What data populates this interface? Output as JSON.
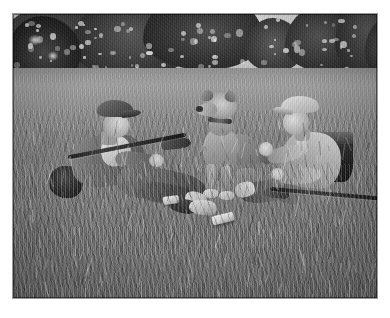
{
  "page": {
    "background_color": "#ffffff",
    "width": 390,
    "height": 318
  },
  "photograph": {
    "title": "Two boys with a dog resting in a meadow",
    "medium": "black-and-white photograph",
    "border_color": "#ffffff",
    "frame_border_color": "#9a9a9a",
    "tone": "monochrome grayscale",
    "alt_text": "Vintage black and white photo of two boys in flat caps sitting in tall grass with a dog sitting upright between them, rifles and a knapsack on the ground, a dark treeline and bright sky behind.",
    "scene": {
      "setting": "open grassy meadow",
      "time_of_day": "daytime",
      "background": {
        "sky_label": "bright overcast sky",
        "sky_color": "#f4f4f4",
        "treeline_label": "dark treeline",
        "treeline_color": "#262626",
        "grass_label": "tall meadow grass",
        "grass_color": "#787878"
      },
      "subjects": [
        {
          "id": "boy-left",
          "label": "Boy reclining on left",
          "pose": "reclining on left elbow, legs extended to the right",
          "wearing": "flat cap, dark jacket, light shirt, knickerbockers, boots",
          "holding": "rifle across body",
          "accessory": "dark satchel on the ground behind him"
        },
        {
          "id": "dog",
          "label": "Dog sitting upright",
          "pose": "seated facing the camera between the two boys",
          "wearing": "collar",
          "breed_look": "short-haired hound"
        },
        {
          "id": "boy-right",
          "label": "Boy seated on right",
          "pose": "seated, legs forward, hand raised",
          "wearing": "flat cap, light knitted sweater, necktie, knickerbockers",
          "holding": "rifle lying across his lap",
          "accessory": "dark knapsack beside him"
        }
      ],
      "props": [
        {
          "id": "ground-book",
          "label": "Pale book on the grass"
        },
        {
          "id": "ground-tin",
          "label": "Small light tin on the grass"
        }
      ]
    }
  }
}
